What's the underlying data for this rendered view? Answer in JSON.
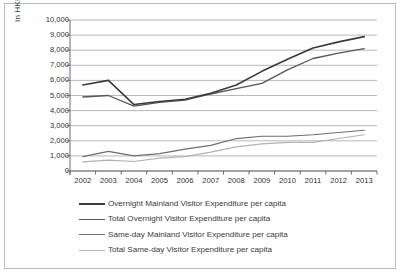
{
  "figure": {
    "name": "visitor-expenditure-per-capita-line-chart",
    "frame_border_color": "#b9b9b9",
    "background": "#ffffff"
  },
  "chart_data": {
    "type": "line",
    "title": "",
    "subtitle": "",
    "xlabel": "",
    "ylabel": "In HKD",
    "x": [
      2002,
      2003,
      2004,
      2005,
      2006,
      2007,
      2008,
      2009,
      2010,
      2011,
      2012,
      2013
    ],
    "xtick_labels": [
      "2002",
      "2003",
      "2004",
      "2005",
      "2006",
      "2007",
      "2008",
      "2009",
      "2010",
      "2011",
      "2012",
      "2013"
    ],
    "ytick_labels": [
      "10,000",
      "9,000",
      "8,000",
      "7,000",
      "6,000",
      "5,000",
      "4,000",
      "3,000",
      "2,000",
      "1,000",
      "0"
    ],
    "ylim": [
      0,
      10000
    ],
    "ytick_step": 1000,
    "grid": "horizontal",
    "legend_position": "below-plot",
    "series": [
      {
        "name": "Overnight Mainland Visitor Expenditure per capita",
        "color": "#3a3a3a",
        "width": 1.6,
        "values": [
          5700,
          6000,
          4400,
          4600,
          4750,
          5150,
          5700,
          6600,
          7400,
          8150,
          8550,
          8900
        ]
      },
      {
        "name": "Total Overnight Visitor Expenditure per capita",
        "color": "#575757",
        "width": 1.3,
        "values": [
          4900,
          5000,
          4300,
          4550,
          4700,
          5100,
          5450,
          5800,
          6700,
          7450,
          7800,
          8100
        ]
      },
      {
        "name": "Same-day Mainland Visitor Expenditure per capita",
        "color": "#6e6e6e",
        "width": 1.2,
        "values": [
          950,
          1300,
          1000,
          1150,
          1450,
          1700,
          2150,
          2300,
          2300,
          2400,
          2550,
          2700
        ]
      },
      {
        "name": "Total Same-day Visitor Expenditure per capita",
        "color": "#b2b2b2",
        "width": 1.2,
        "values": [
          600,
          720,
          630,
          850,
          950,
          1250,
          1600,
          1800,
          1900,
          1900,
          2150,
          2400
        ]
      }
    ]
  },
  "legend": {
    "entries": [
      {
        "label": "Overnight Mainland Visitor Expenditure per capita",
        "color": "#3a3a3a",
        "width": 2.0
      },
      {
        "label": "Total Overnight Visitor Expenditure per capita",
        "color": "#575757",
        "width": 1.6
      },
      {
        "label": "Same-day Mainland Visitor Expenditure per capita",
        "color": "#6e6e6e",
        "width": 1.5
      },
      {
        "label": "Total Same-day Visitor Expenditure per capita",
        "color": "#b2b2b2",
        "width": 1.2
      }
    ]
  },
  "axes": {
    "y_title": "In HKD",
    "grid_color": "#9a9a9a",
    "axis_color": "#6b6b6b"
  }
}
